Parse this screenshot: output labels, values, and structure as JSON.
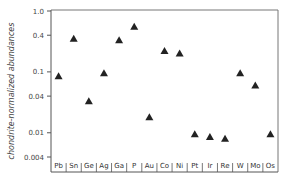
{
  "chart_data": {
    "type": "scatter",
    "title": "",
    "xlabel": "",
    "ylabel": "chondrite-normalized abundances",
    "yscale": "log",
    "ylim": [
      0.004,
      1.0
    ],
    "yticks": [
      1.0,
      0.4,
      0.1,
      0.04,
      0.01,
      0.004
    ],
    "ytick_labels": [
      "1.0",
      "0.4",
      "0.1",
      "0.04",
      "0.01",
      "0.004"
    ],
    "grid": false,
    "legend": null,
    "marker": "triangle",
    "marker_color": "#222222",
    "categories": [
      "Pb",
      "Sn",
      "Ge",
      "Ag",
      "Ga",
      "P",
      "Au",
      "Co",
      "Ni",
      "Pt",
      "Ir",
      "Re",
      "W",
      "Mo",
      "Os"
    ],
    "values": [
      0.085,
      0.35,
      0.033,
      0.095,
      0.33,
      0.55,
      0.018,
      0.22,
      0.2,
      0.0095,
      0.0085,
      0.008,
      0.095,
      0.06,
      0.0095
    ]
  }
}
